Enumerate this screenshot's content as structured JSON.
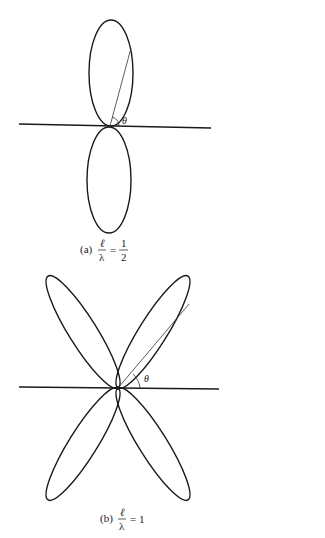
{
  "figure": {
    "panels": [
      {
        "id": "a",
        "label": "(a)",
        "ratio_numerator": "ℓ",
        "ratio_denominator": "λ",
        "equals": "=",
        "value_numerator": "1",
        "value_denominator": "2",
        "angle_symbol": "θ",
        "lobe_count": 2
      },
      {
        "id": "b",
        "label": "(b)",
        "ratio_numerator": "ℓ",
        "ratio_denominator": "λ",
        "equals": "= 1",
        "angle_symbol": "θ",
        "lobe_count": 4
      }
    ]
  }
}
